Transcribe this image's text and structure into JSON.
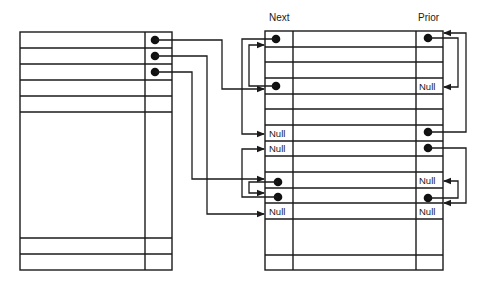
{
  "diagram": {
    "type": "doubly-linked-list-free-chains",
    "headers": {
      "next": "Next",
      "prior": "Prior"
    },
    "null_label": "Null",
    "colors": {
      "ink": "#1a1a1a",
      "background": "#ffffff"
    },
    "left_table": {
      "rows_top": 3,
      "pointer_rows": [
        0,
        1,
        2
      ],
      "pointer_targets": {
        "0": 3,
        "1": 11,
        "2": 10
      }
    },
    "right_table": {
      "rows": [
        {
          "index": 0,
          "next": "pointer",
          "prior": "pointer"
        },
        {
          "index": 1,
          "next": "",
          "prior": ""
        },
        {
          "index": 2,
          "next": "",
          "prior": ""
        },
        {
          "index": 3,
          "next": "pointer",
          "prior": "Null"
        },
        {
          "index": 4,
          "next": "",
          "prior": ""
        },
        {
          "index": 5,
          "next": "",
          "prior": ""
        },
        {
          "index": 6,
          "next": "Null",
          "prior": "pointer"
        },
        {
          "index": 7,
          "next": "Null",
          "prior": "pointer"
        },
        {
          "index": 8,
          "next": "",
          "prior": ""
        },
        {
          "index": 9,
          "next": "",
          "prior": ""
        },
        {
          "index": 10,
          "next": "pointer",
          "prior": "Null"
        },
        {
          "index": 11,
          "next": "pointer",
          "prior": "pointer"
        },
        {
          "index": 12,
          "next": "Null",
          "prior": "Null"
        }
      ],
      "next_links": [
        {
          "from": 0,
          "to": 6
        },
        {
          "from": 3,
          "to": 0
        },
        {
          "from": 10,
          "to": 11
        },
        {
          "from": 11,
          "to": 7
        }
      ],
      "prior_links": [
        {
          "from": 0,
          "to": 3
        },
        {
          "from": 6,
          "to": 0
        },
        {
          "from": 7,
          "to": 11
        },
        {
          "from": 11,
          "to": 10
        }
      ]
    },
    "labels": {
      "r3_prior": "Null",
      "r6_next": "Null",
      "r7_next": "Null",
      "r10_prior": "Null",
      "r12_next": "Null",
      "r12_prior": "Null"
    }
  }
}
